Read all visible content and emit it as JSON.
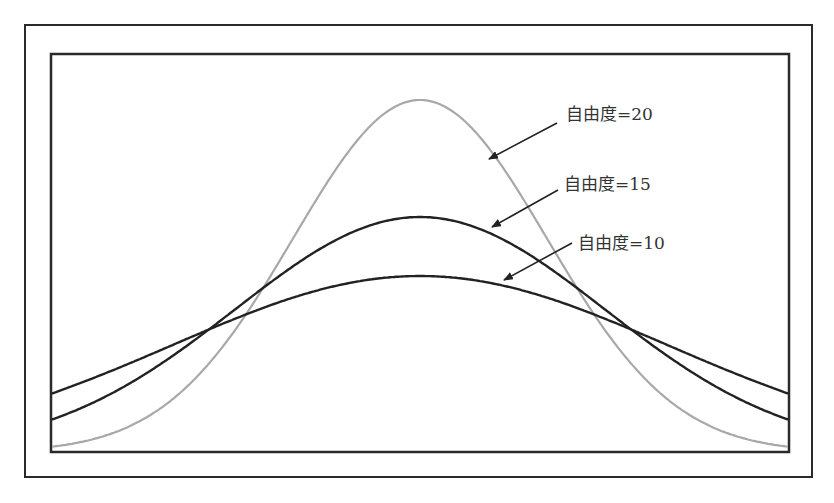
{
  "chart_data": {
    "type": "line",
    "title": "",
    "xlabel": "",
    "ylabel": "",
    "grid": false,
    "legend_position": "inline annotations with arrows",
    "x_range": [
      -2.9,
      2.9
    ],
    "series": [
      {
        "name": "自由度=20",
        "label": "自由度=20",
        "color": "#a8a8a8",
        "peak": 0.88,
        "sigma": 127
      },
      {
        "name": "自由度=15",
        "label": "自由度=15",
        "color": "#222222",
        "peak": 0.59,
        "sigma": 185
      },
      {
        "name": "自由度=10",
        "label": "自由度=10",
        "color": "#222222",
        "peak": 0.44,
        "sigma": 248
      }
    ],
    "annotations": [
      {
        "text": "自由度=20",
        "target_series": "自由度=20"
      },
      {
        "text": "自由度=15",
        "target_series": "自由度=15"
      },
      {
        "text": "自由度=10",
        "target_series": "自由度=10"
      }
    ]
  },
  "render": {
    "plot": {
      "left": 51,
      "top": 54,
      "right": 789,
      "bottom": 452,
      "center_x": 420
    },
    "curves": [
      {
        "amp": 352,
        "sigma": 127,
        "color": "#a8a8a8",
        "width": 2.2
      },
      {
        "amp": 235,
        "sigma": 185,
        "color": "#222222",
        "width": 2.4
      },
      {
        "amp": 176,
        "sigma": 248,
        "color": "#222222",
        "width": 2.4
      }
    ],
    "arrows": [
      {
        "x1": 557,
        "y1": 123,
        "x2": 489,
        "y2": 159
      },
      {
        "x1": 558,
        "y1": 190,
        "x2": 492,
        "y2": 227
      },
      {
        "x1": 572,
        "y1": 243,
        "x2": 504,
        "y2": 280
      }
    ],
    "labels": [
      {
        "x": 566,
        "y": 120
      },
      {
        "x": 564,
        "y": 190
      },
      {
        "x": 578,
        "y": 249
      }
    ]
  }
}
